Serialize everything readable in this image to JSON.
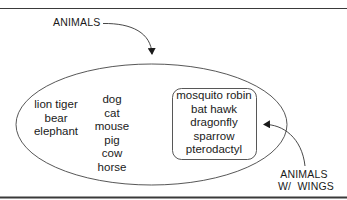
{
  "diagram": {
    "type": "set-diagram",
    "outer_set": {
      "label": "ANIMALS",
      "shape": "ellipse"
    },
    "inner_set": {
      "label_line1": "ANIMALS",
      "label_line2": "W/  WINGS",
      "shape": "rounded-rectangle"
    },
    "groups": {
      "large_animals": [
        "lion tiger",
        "bear",
        "elephant"
      ],
      "domestic_animals": [
        "dog",
        "cat",
        "mouse",
        "pig",
        "cow",
        "horse"
      ],
      "winged_animals": [
        "mosquito robin",
        "bat hawk",
        "dragonfly",
        "sparrow",
        "pterodactyl"
      ]
    },
    "colors": {
      "line": "#333333",
      "text": "#1a1a1a",
      "background": "#ffffff",
      "border": "#3a3a3a"
    }
  }
}
